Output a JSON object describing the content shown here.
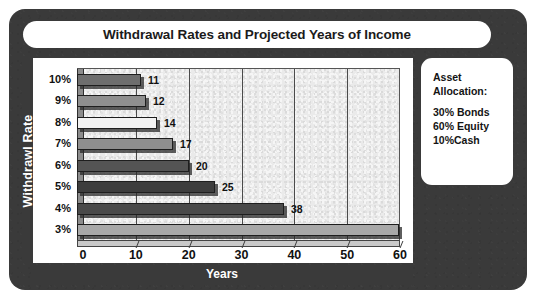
{
  "figure": {
    "title": "Withdrawal Rates and Projected Years of Income",
    "frame_color": "#3a3a3a",
    "panel_color": "#ffffff"
  },
  "legend": {
    "heading_lines": [
      "Asset",
      "Allocation:"
    ],
    "items": [
      "30% Bonds",
      "60% Equity",
      "10%Cash"
    ]
  },
  "chart_data": {
    "type": "bar",
    "orientation": "horizontal",
    "title": "Withdrawal Rates and Projected Years of Income",
    "xlabel": "Years",
    "ylabel": "Withdrawl Rate",
    "categories": [
      "10%",
      "9%",
      "8%",
      "7%",
      "6%",
      "5%",
      "4%",
      "3%"
    ],
    "values": [
      11,
      12,
      14,
      17,
      20,
      25,
      38,
      60
    ],
    "data_labels": [
      "11",
      "12",
      "14",
      "17",
      "20",
      "25",
      "38",
      ""
    ],
    "bar_colors": [
      "#6e6e6e",
      "#8f8f8f",
      "#f2f2f2",
      "#8f8f8f",
      "#545454",
      "#3d3d3d",
      "#4a4a4a",
      "#a8a8a8"
    ],
    "xlim": [
      0,
      60
    ],
    "xticks": [
      0,
      10,
      20,
      30,
      40,
      50,
      60
    ],
    "xtick_labels": [
      "0",
      "10",
      "20",
      "30",
      "40",
      "50",
      "60"
    ],
    "gridlines": [
      10,
      20,
      30,
      40,
      50
    ],
    "grid": true,
    "legend_position": "right-outside",
    "plot_background": "#ececec",
    "annotations": [
      "Asset Allocation: 30% Bonds, 60% Equity, 10%Cash"
    ]
  }
}
